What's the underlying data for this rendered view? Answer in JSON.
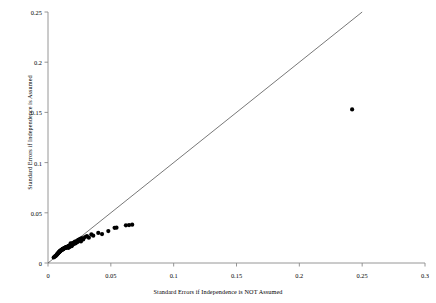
{
  "chart_data": {
    "type": "scatter",
    "title": "",
    "xlabel": "Standard Errors if Independence is NOT Assumed",
    "ylabel": "Standard Errors if Independence is Assumed",
    "xlim": [
      0,
      0.3
    ],
    "ylim": [
      0,
      0.25
    ],
    "xticks": [
      0,
      0.05,
      0.1,
      0.15,
      0.2,
      0.25,
      0.3
    ],
    "yticks": [
      0,
      0.05,
      0.1,
      0.15,
      0.2,
      0.25
    ],
    "xtick_labels": [
      "0",
      "0.05",
      "0.1",
      "0.15",
      "0.2",
      "0.25",
      "0.3"
    ],
    "ytick_labels": [
      "0",
      "0.05",
      "0.1",
      "0.15",
      "0.2",
      "0.25"
    ],
    "grid": false,
    "legend": null,
    "marker": "filled-circle",
    "marker_color": "#000000",
    "reference_line": {
      "name": "identity-line",
      "description": "y = x diagonal reference line",
      "x": [
        0,
        0.25
      ],
      "y": [
        0,
        0.25
      ],
      "color": "#555555"
    },
    "points": [
      {
        "x": 0.0045,
        "y": 0.0055
      },
      {
        "x": 0.0052,
        "y": 0.0062
      },
      {
        "x": 0.0058,
        "y": 0.0068
      },
      {
        "x": 0.0063,
        "y": 0.0072
      },
      {
        "x": 0.0068,
        "y": 0.008
      },
      {
        "x": 0.0072,
        "y": 0.0085
      },
      {
        "x": 0.0075,
        "y": 0.009
      },
      {
        "x": 0.0078,
        "y": 0.0094
      },
      {
        "x": 0.008,
        "y": 0.0098
      },
      {
        "x": 0.0083,
        "y": 0.0101
      },
      {
        "x": 0.0086,
        "y": 0.0105
      },
      {
        "x": 0.0088,
        "y": 0.0108
      },
      {
        "x": 0.009,
        "y": 0.011
      },
      {
        "x": 0.0092,
        "y": 0.0113
      },
      {
        "x": 0.0094,
        "y": 0.0116
      },
      {
        "x": 0.0096,
        "y": 0.0118
      },
      {
        "x": 0.0098,
        "y": 0.012
      },
      {
        "x": 0.01,
        "y": 0.0122
      },
      {
        "x": 0.0102,
        "y": 0.0124
      },
      {
        "x": 0.0104,
        "y": 0.0126
      },
      {
        "x": 0.0106,
        "y": 0.0128
      },
      {
        "x": 0.0108,
        "y": 0.013
      },
      {
        "x": 0.011,
        "y": 0.0132
      },
      {
        "x": 0.0112,
        "y": 0.0133
      },
      {
        "x": 0.0114,
        "y": 0.0135
      },
      {
        "x": 0.0116,
        "y": 0.0136
      },
      {
        "x": 0.0118,
        "y": 0.0138
      },
      {
        "x": 0.012,
        "y": 0.014
      },
      {
        "x": 0.0122,
        "y": 0.0141
      },
      {
        "x": 0.0124,
        "y": 0.0143
      },
      {
        "x": 0.0126,
        "y": 0.0144
      },
      {
        "x": 0.0128,
        "y": 0.0146
      },
      {
        "x": 0.013,
        "y": 0.0147
      },
      {
        "x": 0.0132,
        "y": 0.0148
      },
      {
        "x": 0.0134,
        "y": 0.015
      },
      {
        "x": 0.0136,
        "y": 0.0151
      },
      {
        "x": 0.0138,
        "y": 0.0152
      },
      {
        "x": 0.014,
        "y": 0.0154
      },
      {
        "x": 0.0142,
        "y": 0.0155
      },
      {
        "x": 0.0144,
        "y": 0.0156
      },
      {
        "x": 0.0146,
        "y": 0.0157
      },
      {
        "x": 0.0148,
        "y": 0.0158
      },
      {
        "x": 0.015,
        "y": 0.016
      },
      {
        "x": 0.0154,
        "y": 0.0162
      },
      {
        "x": 0.0158,
        "y": 0.0164
      },
      {
        "x": 0.016,
        "y": 0.015
      },
      {
        "x": 0.0162,
        "y": 0.0166
      },
      {
        "x": 0.0165,
        "y": 0.0168
      },
      {
        "x": 0.0168,
        "y": 0.017
      },
      {
        "x": 0.017,
        "y": 0.0158
      },
      {
        "x": 0.0172,
        "y": 0.0172
      },
      {
        "x": 0.0175,
        "y": 0.0174
      },
      {
        "x": 0.0178,
        "y": 0.0176
      },
      {
        "x": 0.018,
        "y": 0.0196
      },
      {
        "x": 0.0182,
        "y": 0.0178
      },
      {
        "x": 0.0185,
        "y": 0.018
      },
      {
        "x": 0.0188,
        "y": 0.0168
      },
      {
        "x": 0.019,
        "y": 0.0192
      },
      {
        "x": 0.0195,
        "y": 0.0182
      },
      {
        "x": 0.02,
        "y": 0.02
      },
      {
        "x": 0.0205,
        "y": 0.0188
      },
      {
        "x": 0.021,
        "y": 0.0205
      },
      {
        "x": 0.0215,
        "y": 0.0212
      },
      {
        "x": 0.022,
        "y": 0.0196
      },
      {
        "x": 0.0228,
        "y": 0.0218
      },
      {
        "x": 0.0235,
        "y": 0.0208
      },
      {
        "x": 0.024,
        "y": 0.023
      },
      {
        "x": 0.0248,
        "y": 0.0222
      },
      {
        "x": 0.0255,
        "y": 0.024
      },
      {
        "x": 0.0262,
        "y": 0.0215
      },
      {
        "x": 0.027,
        "y": 0.0248
      },
      {
        "x": 0.028,
        "y": 0.0235
      },
      {
        "x": 0.0295,
        "y": 0.0258
      },
      {
        "x": 0.031,
        "y": 0.0268
      },
      {
        "x": 0.0325,
        "y": 0.0252
      },
      {
        "x": 0.0345,
        "y": 0.0285
      },
      {
        "x": 0.036,
        "y": 0.0272
      },
      {
        "x": 0.04,
        "y": 0.03
      },
      {
        "x": 0.043,
        "y": 0.0288
      },
      {
        "x": 0.048,
        "y": 0.0318
      },
      {
        "x": 0.053,
        "y": 0.035
      },
      {
        "x": 0.0545,
        "y": 0.0352
      },
      {
        "x": 0.062,
        "y": 0.0375
      },
      {
        "x": 0.0645,
        "y": 0.0378
      },
      {
        "x": 0.067,
        "y": 0.0382
      },
      {
        "x": 0.242,
        "y": 0.153
      }
    ]
  }
}
